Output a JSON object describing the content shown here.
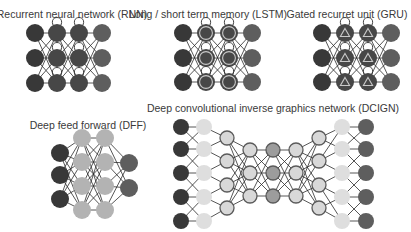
{
  "colors": {
    "input": "#383838",
    "output": "#5e5e5e",
    "recurrent": "#474747",
    "memory_ring": "#c8c8c8",
    "hidden_light": "#b3b3b3",
    "kernel": "#dedede",
    "conv_fill": "#d8d8d8",
    "conv_stroke": "#5a5a5a",
    "pool_fill": "#9c9c9c",
    "probabilistic": "#e6e6e6",
    "background": "#ffffff"
  },
  "diagrams": [
    {
      "id": "rnn",
      "title": "Recurrent neural network (RNN)",
      "layers": [
        {
          "type": "input",
          "count": 3
        },
        {
          "type": "recurrent",
          "count": 3
        },
        {
          "type": "recurrent",
          "count": 3
        },
        {
          "type": "output",
          "count": 3
        }
      ],
      "connections": "dense",
      "self_loops": true
    },
    {
      "id": "lstm",
      "title": "Long / short term memory (LSTM)",
      "layers": [
        {
          "type": "input",
          "count": 3
        },
        {
          "type": "memory",
          "count": 3
        },
        {
          "type": "memory",
          "count": 3
        },
        {
          "type": "output",
          "count": 3
        }
      ],
      "connections": "dense",
      "self_loops": true
    },
    {
      "id": "gru",
      "title": "Gated recurret unit (GRU)",
      "layers": [
        {
          "type": "input",
          "count": 3
        },
        {
          "type": "gated",
          "count": 3
        },
        {
          "type": "gated",
          "count": 3
        },
        {
          "type": "output",
          "count": 3
        }
      ],
      "connections": "dense",
      "self_loops": true
    },
    {
      "id": "dff",
      "title": "Deep feed forward (DFF)",
      "layers": [
        {
          "type": "input",
          "count": 3
        },
        {
          "type": "hidden",
          "count": 4
        },
        {
          "type": "hidden",
          "count": 4
        },
        {
          "type": "output",
          "count": 2
        }
      ],
      "connections": "dense",
      "self_loops": false
    },
    {
      "id": "dcign",
      "title": "Deep convolutional inverse graphics network (DCIGN)",
      "layers": [
        {
          "type": "input",
          "count": 5
        },
        {
          "type": "kernel",
          "count": 5
        },
        {
          "type": "conv",
          "count": 4
        },
        {
          "type": "conv",
          "count": 3
        },
        {
          "type": "probabilistic",
          "count": 3
        },
        {
          "type": "conv",
          "count": 3
        },
        {
          "type": "conv",
          "count": 4
        },
        {
          "type": "kernel",
          "count": 5
        },
        {
          "type": "output",
          "count": 5
        }
      ],
      "connections": "mixed",
      "self_loops": false
    }
  ]
}
